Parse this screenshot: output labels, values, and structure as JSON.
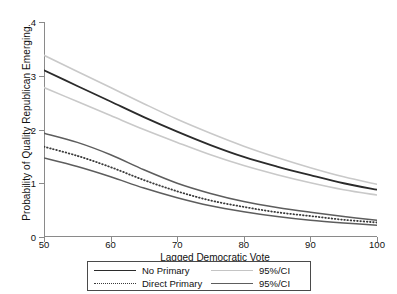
{
  "chart_data": {
    "type": "line",
    "title": "",
    "xlabel": "Lagged Democratic Vote",
    "ylabel": "Probability of Quality Republican Emerging",
    "xlim": [
      50,
      100
    ],
    "ylim": [
      0,
      0.4
    ],
    "xticks": [
      50,
      60,
      70,
      80,
      90,
      100
    ],
    "xticklabels": [
      "50",
      "60",
      "70",
      "80",
      "90",
      "100"
    ],
    "yticks": [
      0,
      0.1,
      0.2,
      0.3,
      0.4
    ],
    "yticklabels": [
      "0",
      ".1",
      ".2",
      ".3",
      ".4"
    ],
    "grid": false,
    "legend_position": "below-axes",
    "x": [
      50,
      55,
      60,
      65,
      70,
      75,
      80,
      85,
      90,
      95,
      100
    ],
    "series": [
      {
        "name": "No Primary",
        "style": "solid",
        "color": "#2b2b2b",
        "width": 1.8,
        "values": [
          0.31,
          0.281,
          0.252,
          0.223,
          0.196,
          0.171,
          0.149,
          0.131,
          0.115,
          0.1,
          0.088
        ]
      },
      {
        "name": "95%/CI",
        "role": "no-primary-ci-upper",
        "style": "solid",
        "color": "#c9c9c9",
        "width": 1.6,
        "values": [
          0.338,
          0.308,
          0.278,
          0.248,
          0.219,
          0.193,
          0.169,
          0.148,
          0.129,
          0.112,
          0.098
        ]
      },
      {
        "name": "95%/CI",
        "role": "no-primary-ci-lower",
        "style": "solid",
        "color": "#c9c9c9",
        "width": 1.6,
        "values": [
          0.278,
          0.252,
          0.226,
          0.2,
          0.176,
          0.153,
          0.133,
          0.116,
          0.101,
          0.088,
          0.078
        ]
      },
      {
        "name": "Direct Primary",
        "style": "dotted",
        "color": "#3a3a3a",
        "width": 1.8,
        "values": [
          0.168,
          0.151,
          0.13,
          0.106,
          0.085,
          0.068,
          0.056,
          0.046,
          0.039,
          0.032,
          0.027
        ]
      },
      {
        "name": "95%/CI",
        "role": "direct-primary-ci-upper",
        "style": "solid",
        "color": "#5d5d5d",
        "width": 1.5,
        "values": [
          0.193,
          0.176,
          0.153,
          0.125,
          0.1,
          0.081,
          0.066,
          0.055,
          0.046,
          0.038,
          0.031
        ]
      },
      {
        "name": "95%/CI",
        "role": "direct-primary-ci-lower",
        "style": "solid",
        "color": "#5d5d5d",
        "width": 1.5,
        "values": [
          0.147,
          0.131,
          0.112,
          0.091,
          0.073,
          0.058,
          0.047,
          0.038,
          0.031,
          0.026,
          0.022
        ]
      }
    ],
    "legend": [
      {
        "label": "No Primary",
        "swatch": "solid-dark"
      },
      {
        "label": "95%/CI",
        "swatch": "solid-light"
      },
      {
        "label": "Direct Primary",
        "swatch": "dotted"
      },
      {
        "label": "95%/CI",
        "swatch": "solid-mid"
      }
    ]
  }
}
